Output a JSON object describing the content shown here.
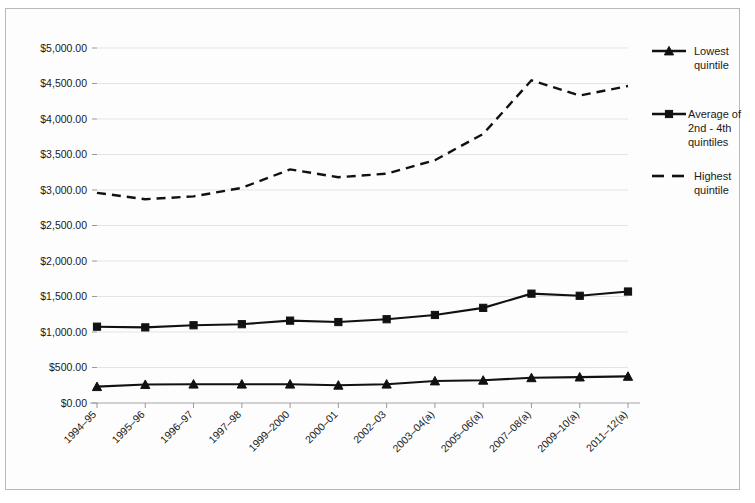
{
  "chart_data": {
    "type": "line",
    "title": "",
    "subtitle": "",
    "xlabel": "",
    "ylabel": "",
    "ylim": [
      0,
      5000
    ],
    "ytick_step": 500,
    "grid": true,
    "legend_position": "right",
    "categories": [
      "1994–95",
      "1995–96",
      "1996–97",
      "1997–98",
      "1999–2000",
      "2000–01",
      "2002–03",
      "2003–04(a)",
      "2005–06(a)",
      "2007–08(a)",
      "2009–10(a)",
      "2011–12(a)"
    ],
    "ytick_labels": [
      "$0.00",
      "$500.00",
      "$1,000.00",
      "$1,500.00",
      "$2,000.00",
      "$2,500.00",
      "$3,000.00",
      "$3,500.00",
      "$4,000.00",
      "$4,500.00",
      "$5,000.00"
    ],
    "ytick_values": [
      0,
      500,
      1000,
      1500,
      2000,
      2500,
      3000,
      3500,
      4000,
      4500,
      5000
    ],
    "series": [
      {
        "name": "Lowest quintile",
        "legend_label": "Lowest quintile",
        "marker": "triangle",
        "dash": false,
        "color": "#111111",
        "values": [
          230,
          260,
          265,
          265,
          265,
          250,
          265,
          310,
          320,
          355,
          365,
          375
        ]
      },
      {
        "name": "Average of 2nd - 4th quintiles",
        "legend_label": "Average of 2nd - 4th quintiles",
        "marker": "square",
        "dash": false,
        "color": "#111111",
        "values": [
          1075,
          1065,
          1095,
          1110,
          1160,
          1140,
          1180,
          1240,
          1340,
          1540,
          1510,
          1570
        ]
      },
      {
        "name": "Highest quintile",
        "legend_label": "Highest quintile",
        "marker": "none",
        "dash": true,
        "color": "#111111",
        "values": [
          2960,
          2870,
          2910,
          3030,
          3290,
          3180,
          3230,
          3420,
          3790,
          4545,
          4330,
          4465
        ]
      }
    ]
  },
  "legend": {
    "entries": [
      {
        "label_lines": [
          "Lowest",
          "quintile"
        ]
      },
      {
        "label_lines": [
          "Average of",
          "2nd - 4th",
          "quintiles"
        ]
      },
      {
        "label_lines": [
          "Highest",
          "quintile"
        ]
      }
    ]
  }
}
